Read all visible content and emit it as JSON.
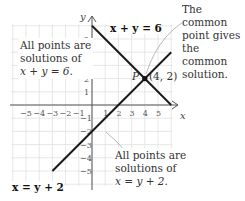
{
  "chart_data": {
    "type": "line",
    "title": "",
    "xlabel": "x",
    "ylabel": "y",
    "xlim": [
      -6,
      6
    ],
    "ylim": [
      -6,
      6
    ],
    "grid": true,
    "x_ticks": [
      -5,
      -4,
      -3,
      -2,
      -1,
      1,
      2,
      3,
      4,
      5
    ],
    "y_ticks": [
      -5,
      -4,
      -3,
      -2,
      -1,
      1,
      2,
      3,
      4,
      5
    ],
    "series": [
      {
        "name": "x + y = 6",
        "points": [
          [
            0,
            6
          ],
          [
            6,
            0
          ]
        ],
        "color": "#1a1a1a"
      },
      {
        "name": "x = y + 2",
        "points": [
          [
            -3,
            -5
          ],
          [
            6,
            4
          ]
        ],
        "color": "#1a1a1a"
      }
    ],
    "intersection": {
      "label": "P",
      "coords_label": "(4, 2)",
      "x": 4,
      "y": 2
    },
    "annotations": [
      {
        "text": "The common point gives the common solution.",
        "target": "P"
      },
      {
        "text": "All points are solutions of x + y = 6."
      },
      {
        "text": "All points are solutions of x = y + 2."
      }
    ]
  },
  "labels": {
    "eq1": "x + y = 6",
    "eq2": "x = y + 2",
    "point_name": "P",
    "point_coords": "(4, 2)",
    "x_axis": "x",
    "y_axis": "y",
    "common_note_1": "The common",
    "common_note_2": "point gives",
    "common_note_3": "the common",
    "common_note_4": "solution.",
    "sol1_line1": "All points are",
    "sol1_line2": "solutions of",
    "sol1_line3": "x + y = 6.",
    "sol2_line1": "All points are",
    "sol2_line2": "solutions of",
    "sol2_line3": "x = y + 2."
  }
}
